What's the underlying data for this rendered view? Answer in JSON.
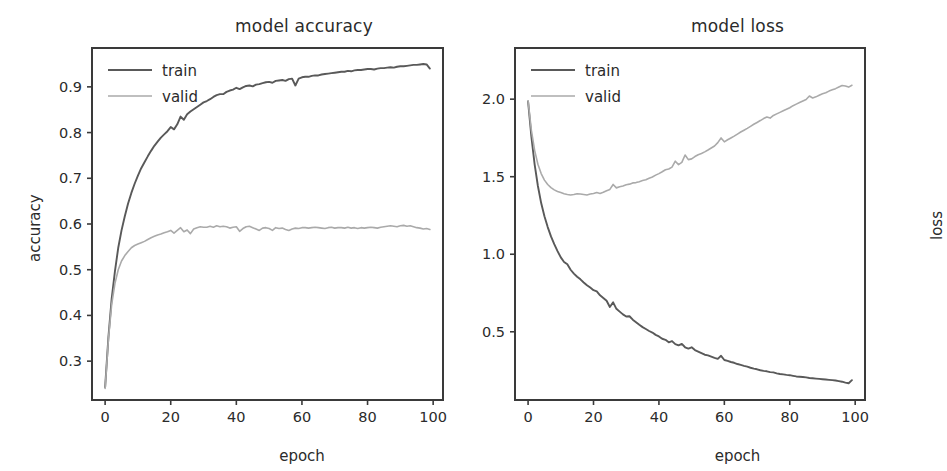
{
  "figure": {
    "background": "#ffffff",
    "width": 903,
    "height": 471
  },
  "colors": {
    "train": "#595959",
    "valid": "#aaaaaa",
    "axis": "#3a3a3a",
    "text": "#2b2b2b"
  },
  "panels": {
    "accuracy": {
      "title": "model accuracy",
      "xlabel": "epoch",
      "ylabel": "accuracy",
      "legend": {
        "train": "train",
        "valid": "valid"
      },
      "xticks": [
        "0",
        "20",
        "40",
        "60",
        "80",
        "100"
      ],
      "yticks": [
        "0.3",
        "0.4",
        "0.5",
        "0.6",
        "0.7",
        "0.8",
        "0.9"
      ]
    },
    "loss": {
      "title": "model loss",
      "xlabel": "epoch",
      "ylabel": "loss",
      "legend": {
        "train": "train",
        "valid": "valid"
      },
      "xticks": [
        "0",
        "20",
        "40",
        "60",
        "80",
        "100"
      ],
      "yticks": [
        "0.5",
        "1.0",
        "1.5",
        "2.0"
      ]
    }
  },
  "chart_data": [
    {
      "type": "line",
      "title": "model accuracy",
      "xlabel": "epoch",
      "ylabel": "accuracy",
      "xlim": [
        -4,
        103
      ],
      "ylim": [
        0.215,
        0.985
      ],
      "grid": false,
      "legend_position": "upper left",
      "xticks": [
        0,
        20,
        40,
        60,
        80,
        100
      ],
      "yticks": [
        0.3,
        0.4,
        0.5,
        0.6,
        0.7,
        0.8,
        0.9
      ],
      "x": [
        0,
        1,
        2,
        3,
        4,
        5,
        6,
        7,
        8,
        9,
        10,
        11,
        12,
        13,
        14,
        15,
        16,
        17,
        18,
        19,
        20,
        21,
        22,
        23,
        24,
        25,
        26,
        27,
        28,
        29,
        30,
        31,
        32,
        33,
        34,
        35,
        36,
        37,
        38,
        39,
        40,
        41,
        42,
        43,
        44,
        45,
        46,
        47,
        48,
        49,
        50,
        51,
        52,
        53,
        54,
        55,
        56,
        57,
        58,
        59,
        60,
        61,
        62,
        63,
        64,
        65,
        66,
        67,
        68,
        69,
        70,
        71,
        72,
        73,
        74,
        75,
        76,
        77,
        78,
        79,
        80,
        81,
        82,
        83,
        84,
        85,
        86,
        87,
        88,
        89,
        90,
        91,
        92,
        93,
        94,
        95,
        96,
        97,
        98,
        99
      ],
      "series": [
        {
          "name": "train",
          "color": "#595959",
          "values": [
            0.243,
            0.352,
            0.437,
            0.497,
            0.548,
            0.586,
            0.617,
            0.645,
            0.668,
            0.688,
            0.706,
            0.722,
            0.735,
            0.748,
            0.76,
            0.771,
            0.78,
            0.789,
            0.796,
            0.803,
            0.812,
            0.807,
            0.818,
            0.835,
            0.828,
            0.84,
            0.846,
            0.851,
            0.856,
            0.861,
            0.866,
            0.869,
            0.873,
            0.878,
            0.882,
            0.884,
            0.884,
            0.889,
            0.892,
            0.894,
            0.898,
            0.895,
            0.899,
            0.902,
            0.903,
            0.901,
            0.905,
            0.906,
            0.908,
            0.91,
            0.911,
            0.909,
            0.913,
            0.914,
            0.915,
            0.913,
            0.917,
            0.918,
            0.903,
            0.918,
            0.921,
            0.922,
            0.922,
            0.924,
            0.925,
            0.925,
            0.927,
            0.928,
            0.929,
            0.93,
            0.931,
            0.932,
            0.933,
            0.933,
            0.935,
            0.934,
            0.936,
            0.937,
            0.937,
            0.938,
            0.939,
            0.939,
            0.938,
            0.94,
            0.941,
            0.941,
            0.942,
            0.943,
            0.942,
            0.944,
            0.945,
            0.945,
            0.946,
            0.947,
            0.948,
            0.948,
            0.949,
            0.95,
            0.949,
            0.94
          ]
        },
        {
          "name": "valid",
          "color": "#aaaaaa",
          "values": [
            0.24,
            0.348,
            0.424,
            0.47,
            0.5,
            0.519,
            0.531,
            0.54,
            0.548,
            0.553,
            0.556,
            0.559,
            0.562,
            0.566,
            0.57,
            0.573,
            0.576,
            0.578,
            0.581,
            0.583,
            0.586,
            0.58,
            0.586,
            0.592,
            0.583,
            0.587,
            0.579,
            0.589,
            0.592,
            0.594,
            0.593,
            0.593,
            0.595,
            0.593,
            0.596,
            0.594,
            0.595,
            0.594,
            0.591,
            0.593,
            0.594,
            0.584,
            0.59,
            0.594,
            0.595,
            0.592,
            0.589,
            0.586,
            0.591,
            0.592,
            0.59,
            0.586,
            0.592,
            0.59,
            0.591,
            0.588,
            0.586,
            0.589,
            0.591,
            0.59,
            0.592,
            0.592,
            0.591,
            0.592,
            0.593,
            0.592,
            0.591,
            0.59,
            0.592,
            0.593,
            0.591,
            0.592,
            0.592,
            0.591,
            0.593,
            0.591,
            0.592,
            0.59,
            0.592,
            0.591,
            0.592,
            0.593,
            0.592,
            0.591,
            0.593,
            0.594,
            0.595,
            0.596,
            0.595,
            0.594,
            0.596,
            0.597,
            0.595,
            0.596,
            0.594,
            0.592,
            0.591,
            0.589,
            0.59,
            0.588
          ]
        }
      ]
    },
    {
      "type": "line",
      "title": "model loss",
      "xlabel": "epoch",
      "ylabel": "loss",
      "xlim": [
        -4,
        103
      ],
      "ylim": [
        0.06,
        2.33
      ],
      "grid": false,
      "legend_position": "upper left",
      "xticks": [
        0,
        20,
        40,
        60,
        80,
        100
      ],
      "yticks": [
        0.5,
        1.0,
        1.5,
        2.0
      ],
      "x": [
        0,
        1,
        2,
        3,
        4,
        5,
        6,
        7,
        8,
        9,
        10,
        11,
        12,
        13,
        14,
        15,
        16,
        17,
        18,
        19,
        20,
        21,
        22,
        23,
        24,
        25,
        26,
        27,
        28,
        29,
        30,
        31,
        32,
        33,
        34,
        35,
        36,
        37,
        38,
        39,
        40,
        41,
        42,
        43,
        44,
        45,
        46,
        47,
        48,
        49,
        50,
        51,
        52,
        53,
        54,
        55,
        56,
        57,
        58,
        59,
        60,
        61,
        62,
        63,
        64,
        65,
        66,
        67,
        68,
        69,
        70,
        71,
        72,
        73,
        74,
        75,
        76,
        77,
        78,
        79,
        80,
        81,
        82,
        83,
        84,
        85,
        86,
        87,
        88,
        89,
        90,
        91,
        92,
        93,
        94,
        95,
        96,
        97,
        98,
        99
      ],
      "series": [
        {
          "name": "train",
          "color": "#595959",
          "values": [
            1.985,
            1.76,
            1.58,
            1.44,
            1.33,
            1.245,
            1.175,
            1.115,
            1.065,
            1.02,
            0.98,
            0.95,
            0.935,
            0.9,
            0.875,
            0.855,
            0.838,
            0.818,
            0.8,
            0.785,
            0.768,
            0.76,
            0.735,
            0.718,
            0.7,
            0.66,
            0.69,
            0.648,
            0.63,
            0.612,
            0.598,
            0.6,
            0.578,
            0.562,
            0.545,
            0.53,
            0.518,
            0.505,
            0.495,
            0.48,
            0.47,
            0.455,
            0.448,
            0.432,
            0.44,
            0.42,
            0.412,
            0.422,
            0.4,
            0.392,
            0.4,
            0.382,
            0.372,
            0.362,
            0.352,
            0.348,
            0.34,
            0.332,
            0.325,
            0.345,
            0.318,
            0.312,
            0.305,
            0.3,
            0.292,
            0.286,
            0.28,
            0.275,
            0.268,
            0.262,
            0.258,
            0.252,
            0.248,
            0.245,
            0.24,
            0.238,
            0.232,
            0.228,
            0.225,
            0.222,
            0.22,
            0.216,
            0.212,
            0.21,
            0.208,
            0.206,
            0.202,
            0.2,
            0.198,
            0.196,
            0.194,
            0.192,
            0.19,
            0.188,
            0.186,
            0.182,
            0.178,
            0.172,
            0.168,
            0.188
          ]
        },
        {
          "name": "valid",
          "color": "#aaaaaa",
          "values": [
            1.99,
            1.8,
            1.67,
            1.58,
            1.52,
            1.478,
            1.45,
            1.43,
            1.415,
            1.405,
            1.398,
            1.39,
            1.385,
            1.382,
            1.385,
            1.39,
            1.388,
            1.385,
            1.382,
            1.388,
            1.392,
            1.398,
            1.392,
            1.4,
            1.41,
            1.418,
            1.45,
            1.428,
            1.435,
            1.44,
            1.448,
            1.452,
            1.46,
            1.462,
            1.468,
            1.475,
            1.48,
            1.49,
            1.498,
            1.51,
            1.52,
            1.532,
            1.545,
            1.55,
            1.562,
            1.6,
            1.578,
            1.592,
            1.64,
            1.61,
            1.615,
            1.63,
            1.642,
            1.65,
            1.66,
            1.672,
            1.685,
            1.698,
            1.72,
            1.75,
            1.725,
            1.738,
            1.75,
            1.762,
            1.775,
            1.788,
            1.8,
            1.812,
            1.825,
            1.838,
            1.85,
            1.862,
            1.875,
            1.885,
            1.878,
            1.895,
            1.905,
            1.915,
            1.925,
            1.935,
            1.945,
            1.958,
            1.968,
            1.978,
            1.988,
            1.998,
            2.02,
            2.008,
            2.015,
            2.025,
            2.035,
            2.042,
            2.052,
            2.06,
            2.068,
            2.078,
            2.088,
            2.085,
            2.078,
            2.09
          ]
        }
      ]
    }
  ]
}
